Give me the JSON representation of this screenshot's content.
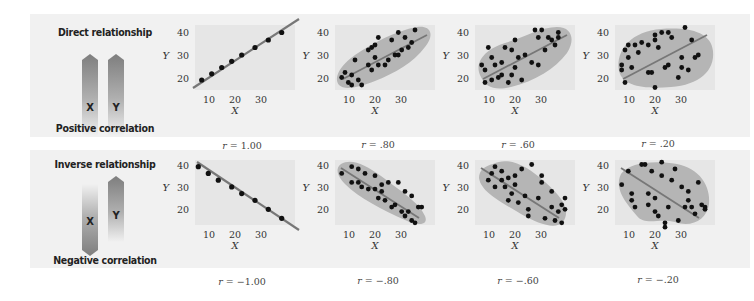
{
  "rows": [
    {
      "relationship": "Direct relationship",
      "correlation_label": "Positive correlation",
      "arrow_x_label": "X",
      "arrow_y_label": "Y",
      "arrow_x_dir": "up",
      "arrow_y_dir": "up"
    },
    {
      "relationship": "Inverse relationship",
      "correlation_label": "Negative correlation",
      "arrow_x_label": "X",
      "arrow_y_label": "Y",
      "arrow_x_dir": "down",
      "arrow_y_dir": "up"
    }
  ],
  "axis": {
    "x_label": "X",
    "y_label": "Y",
    "x_ticks": [
      "10",
      "20",
      "30"
    ],
    "y_ticks": [
      "40",
      "30",
      "20"
    ]
  },
  "r_labels": {
    "prefix": "r",
    "top": [
      "= 1.00",
      "= .80",
      "= .60",
      "= .20"
    ],
    "bottom": [
      "= −1.00",
      "= −.80",
      "= −.60",
      "= −.20"
    ]
  },
  "colors": {
    "panel_bg": "#e6e6e6",
    "envelope": "#b5b5b5",
    "band_bg": "#f1f1f1",
    "dot": "#111111",
    "line": "#777777"
  },
  "chart_data": [
    {
      "type": "scatter",
      "title": "r = 1.00",
      "xlabel": "X",
      "ylabel": "Y",
      "xlim": [
        5,
        35
      ],
      "ylim": [
        17,
        43
      ],
      "x": [
        7,
        10,
        13,
        16,
        19,
        23,
        27,
        31
      ],
      "y": [
        21,
        23.5,
        26,
        28.5,
        31,
        34,
        37,
        40
      ],
      "trend": "positive",
      "r": 1.0
    },
    {
      "type": "scatter",
      "title": "r = .80",
      "xlabel": "X",
      "ylabel": "Y",
      "xlim": [
        5,
        35
      ],
      "ylim": [
        17,
        43
      ],
      "r": 0.8,
      "x": [
        7,
        8,
        9,
        10,
        10,
        11,
        12,
        13,
        15,
        15,
        16,
        16,
        17,
        17,
        18,
        18,
        20,
        21,
        22,
        23,
        24,
        24,
        25,
        26,
        27,
        28,
        29
      ],
      "y": [
        22,
        24,
        20,
        19,
        23,
        29,
        21,
        19,
        27,
        33,
        25,
        34,
        30,
        35,
        27,
        38,
        27,
        29,
        37,
        31,
        31,
        40,
        33,
        38,
        34,
        36,
        41
      ],
      "trend": "positive"
    },
    {
      "type": "scatter",
      "title": "r = .60",
      "xlabel": "X",
      "ylabel": "Y",
      "xlim": [
        5,
        35
      ],
      "ylim": [
        17,
        43
      ],
      "r": 0.6,
      "x": [
        7,
        8,
        8,
        9,
        10,
        10,
        11,
        12,
        13,
        13,
        14,
        15,
        16,
        16,
        17,
        17,
        18,
        19,
        20,
        22,
        23,
        24,
        24,
        25,
        26,
        27,
        28,
        29,
        30,
        30
      ],
      "y": [
        27,
        25,
        20,
        34,
        30,
        21,
        27,
        22,
        28,
        23,
        34,
        20,
        33,
        23,
        26,
        37,
        30,
        21,
        31,
        28,
        41,
        27,
        38,
        41,
        33,
        38,
        37,
        35,
        38,
        40
      ],
      "trend": "positive"
    },
    {
      "type": "scatter",
      "title": "r = .20",
      "xlabel": "X",
      "ylabel": "Y",
      "xlim": [
        5,
        35
      ],
      "ylim": [
        17,
        43
      ],
      "r": 0.2,
      "x": [
        7,
        7,
        8,
        8,
        9,
        9,
        10,
        11,
        12,
        13,
        15,
        15,
        16,
        17,
        17,
        17,
        18,
        19,
        20,
        21,
        21,
        22,
        24,
        25,
        25,
        26,
        27,
        28,
        29,
        30
      ],
      "y": [
        25,
        27,
        20,
        33,
        35,
        30,
        26,
        35,
        32,
        36,
        35,
        24,
        24,
        18,
        37,
        39,
        34,
        40,
        26,
        40,
        27,
        38,
        22,
        30,
        26,
        42,
        25,
        37,
        30,
        31
      ],
      "trend": "positive"
    },
    {
      "type": "scatter",
      "title": "r = −1.00",
      "xlabel": "X",
      "ylabel": "Y",
      "xlim": [
        5,
        35
      ],
      "ylim": [
        14,
        43
      ],
      "x": [
        6,
        9,
        12,
        16,
        19,
        23,
        27,
        31
      ],
      "y": [
        40,
        37,
        34,
        31,
        28,
        25,
        21,
        17
      ],
      "trend": "negative",
      "r": -1.0
    },
    {
      "type": "scatter",
      "title": "r = −.80",
      "xlabel": "X",
      "ylabel": "Y",
      "xlim": [
        5,
        35
      ],
      "ylim": [
        14,
        43
      ],
      "r": -0.8,
      "x": [
        7,
        10,
        10,
        12,
        12,
        13,
        14,
        15,
        17,
        17,
        18,
        19,
        19,
        20,
        21,
        22,
        23,
        24,
        25,
        26,
        26,
        27,
        28,
        28,
        29,
        30,
        31
      ],
      "y": [
        37,
        40,
        33,
        33,
        39,
        31,
        37,
        30,
        36,
        30,
        26,
        29,
        32,
        25,
        33,
        22,
        23,
        33,
        20,
        29,
        18,
        20,
        27,
        16,
        15,
        22,
        22
      ],
      "trend": "negative"
    },
    {
      "type": "scatter",
      "title": "r = −.60",
      "xlabel": "X",
      "ylabel": "Y",
      "xlim": [
        5,
        35
      ],
      "ylim": [
        14,
        43
      ],
      "r": -0.6,
      "x": [
        9,
        10,
        11,
        11,
        13,
        13,
        14,
        15,
        15,
        16,
        17,
        17,
        18,
        19,
        20,
        21,
        21,
        22,
        24,
        25,
        25,
        26,
        28,
        28,
        29,
        30,
        31,
        31,
        32,
        32
      ],
      "y": [
        34,
        37,
        31,
        40,
        38,
        34,
        31,
        25,
        35,
        28,
        36,
        32,
        24,
        39,
        27,
        21,
        18,
        41,
        26,
        33,
        36,
        17,
        29,
        22,
        16,
        20,
        15,
        23,
        21,
        26
      ],
      "trend": "negative"
    },
    {
      "type": "scatter",
      "title": "r = −.20",
      "xlabel": "X",
      "ylabel": "Y",
      "xlim": [
        5,
        35
      ],
      "ylim": [
        14,
        43
      ],
      "r": -0.2,
      "x": [
        7,
        9,
        10,
        10,
        11,
        13,
        14,
        15,
        15,
        16,
        17,
        17,
        18,
        19,
        19,
        20,
        20,
        21,
        22,
        23,
        24,
        25,
        26,
        27,
        27,
        28,
        29,
        30,
        31,
        32,
        32
      ],
      "y": [
        32,
        38,
        28,
        25,
        22,
        41,
        41,
        23,
        28,
        38,
        26,
        20,
        18,
        42,
        36,
        15,
        13,
        22,
        34,
        39,
        16,
        31,
        22,
        29,
        25,
        22,
        19,
        33,
        23,
        22,
        21
      ],
      "trend": "negative"
    }
  ]
}
